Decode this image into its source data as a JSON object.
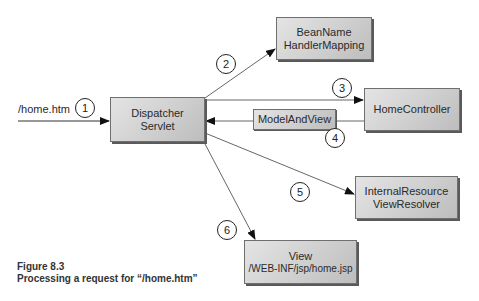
{
  "diagram": {
    "request_label": "/home.htm",
    "nodes": {
      "dispatcher": {
        "line1": "Dispatcher",
        "line2": "Servlet"
      },
      "handler_mapping": {
        "line1": "BeanName",
        "line2": "HandlerMapping"
      },
      "home_controller": {
        "line1": "HomeController"
      },
      "model_and_view": {
        "line1": "ModelAndView"
      },
      "view_resolver": {
        "line1": "InternalResource",
        "line2": "ViewResolver"
      },
      "view": {
        "line1": "View",
        "line2": "/WEB-INF/jsp/home.jsp"
      }
    },
    "steps": [
      "1",
      "2",
      "3",
      "4",
      "5",
      "6"
    ]
  },
  "caption": {
    "title": "Figure 8.3",
    "text": "Processing a request for “/home.htm”"
  }
}
